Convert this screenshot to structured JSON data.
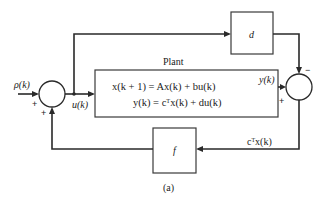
{
  "diagram": {
    "type": "block-diagram",
    "caption": "(a)",
    "plant": {
      "title": "Plant",
      "equation_1": "x(k + 1) = Ax(k) + bu(k)",
      "equation_2": "y(k) = cᵀx(k) + du(k)"
    },
    "blocks": {
      "d": "d",
      "f": "f"
    },
    "signals": {
      "input": "ρ(k)",
      "control": "u(k)",
      "output": "y(k)",
      "feedback": "cᵀx(k)"
    },
    "left_junction_signs": {
      "input_sign": "+",
      "feedback_sign": "+"
    },
    "right_junction_signs": {
      "d_path_sign": "−",
      "output_sign": "+"
    }
  }
}
